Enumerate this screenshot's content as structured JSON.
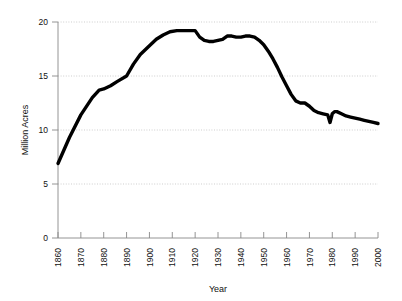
{
  "chart_data": {
    "type": "line",
    "title": "",
    "xlabel": "Year",
    "ylabel": "Million Acres",
    "xlim": [
      1860,
      2000
    ],
    "ylim": [
      0,
      20
    ],
    "grid": true,
    "legend": false,
    "x_ticks": [
      1860,
      1870,
      1880,
      1890,
      1900,
      1910,
      1920,
      1930,
      1940,
      1950,
      1960,
      1970,
      1980,
      1990,
      2000
    ],
    "y_ticks": [
      0,
      5,
      10,
      15,
      20
    ],
    "line_color": "#000000",
    "grid_color": "#b9b9b9",
    "axis_color": "#888888",
    "series": [
      {
        "name": "Million Acres",
        "x": [
          1860,
          1865,
          1870,
          1875,
          1878,
          1880,
          1883,
          1886,
          1890,
          1893,
          1896,
          1900,
          1903,
          1906,
          1909,
          1912,
          1915,
          1918,
          1920,
          1922,
          1924,
          1926,
          1928,
          1930,
          1932,
          1934,
          1936,
          1938,
          1940,
          1942,
          1944,
          1946,
          1948,
          1950,
          1952,
          1954,
          1956,
          1958,
          1960,
          1962,
          1964,
          1966,
          1968,
          1970,
          1972,
          1974,
          1976,
          1978,
          1979,
          1980,
          1981,
          1982,
          1984,
          1986,
          1988,
          1990,
          1992,
          1994,
          1996,
          1998,
          2000
        ],
        "y": [
          6.9,
          9.3,
          11.4,
          13.0,
          13.7,
          13.8,
          14.1,
          14.5,
          15.0,
          16.1,
          17.0,
          17.8,
          18.4,
          18.8,
          19.1,
          19.2,
          19.2,
          19.2,
          19.2,
          18.6,
          18.3,
          18.2,
          18.2,
          18.3,
          18.4,
          18.7,
          18.7,
          18.6,
          18.6,
          18.7,
          18.7,
          18.6,
          18.3,
          17.9,
          17.3,
          16.6,
          15.8,
          14.9,
          14.1,
          13.3,
          12.7,
          12.5,
          12.5,
          12.2,
          11.8,
          11.6,
          11.5,
          11.4,
          10.7,
          11.5,
          11.7,
          11.7,
          11.5,
          11.3,
          11.2,
          11.1,
          11.0,
          10.9,
          10.8,
          10.7,
          10.6
        ]
      }
    ]
  },
  "axes": {
    "ylabel_text": "Million Acres",
    "xlabel_text": "Year",
    "y_tick_labels": [
      "20",
      "15",
      "10",
      "5",
      "0"
    ],
    "x_tick_labels": [
      "1860",
      "1870",
      "1880",
      "1890",
      "1900",
      "1910",
      "1920",
      "1930",
      "1940",
      "1950",
      "1960",
      "1970",
      "1980",
      "1990",
      "2000"
    ]
  }
}
